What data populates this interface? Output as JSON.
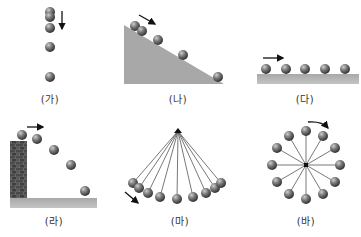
{
  "figure": {
    "colors": {
      "ball_dark": "#3a3a3a",
      "ball_mid": "#7a7a7a",
      "ball_light": "#c8c8c8",
      "ground": "#b0b0b0",
      "slope": "#a9a9a9",
      "brick": "#555555",
      "line": "#555555",
      "arrow": "#111111"
    },
    "panels": [
      {
        "id": "ga",
        "label": "(가)",
        "motion": "free-fall",
        "arrow": "down"
      },
      {
        "id": "na",
        "label": "(나)",
        "motion": "incline",
        "arrow": "down-right"
      },
      {
        "id": "da",
        "label": "(다)",
        "motion": "uniform-horizontal",
        "arrow": "right"
      },
      {
        "id": "ra",
        "label": "(라)",
        "motion": "projectile",
        "arrow": "right"
      },
      {
        "id": "ma",
        "label": "(마)",
        "motion": "pendulum",
        "arrow": "down-right"
      },
      {
        "id": "ba",
        "label": "(바)",
        "motion": "circular",
        "arrow": "clockwise"
      }
    ]
  }
}
